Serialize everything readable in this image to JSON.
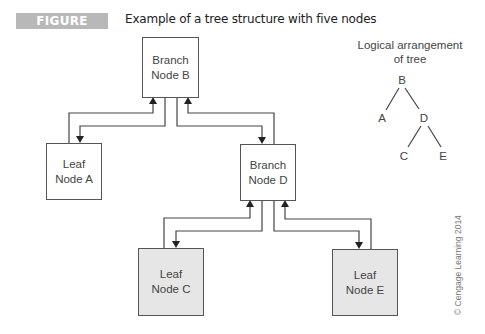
{
  "figure": {
    "label": "FIGURE 12.66",
    "caption": "Example of a tree structure with five nodes",
    "badge_color": "#b8b8b8"
  },
  "nodes": {
    "B": {
      "line1": "Branch",
      "line2": "Node B",
      "fill": "white"
    },
    "A": {
      "line1": "Leaf",
      "line2": "Node A",
      "fill": "white"
    },
    "D": {
      "line1": "Branch",
      "line2": "Node D",
      "fill": "white"
    },
    "C": {
      "line1": "Leaf",
      "line2": "Node C",
      "fill": "gray"
    },
    "E": {
      "line1": "Leaf",
      "line2": "Node E",
      "fill": "gray"
    }
  },
  "logical": {
    "title_line1": "Logical arrangement",
    "title_line2": "of tree",
    "letters": {
      "B": "B",
      "A": "A",
      "D": "D",
      "C": "C",
      "E": "E"
    },
    "edges": [
      [
        "B",
        "A"
      ],
      [
        "B",
        "D"
      ],
      [
        "D",
        "C"
      ],
      [
        "D",
        "E"
      ]
    ]
  },
  "copyright": "© Cengage Learning 2014"
}
